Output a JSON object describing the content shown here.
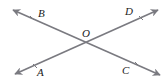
{
  "diagram": {
    "title": "",
    "line_color": "#7a7a80",
    "label_color": "#222222",
    "intersection": {
      "label": "O",
      "x": 87,
      "y": 43
    },
    "lines": [
      {
        "name": "line-BC",
        "from": {
          "x": 13,
          "y": 10
        },
        "to": {
          "x": 160,
          "y": 75
        },
        "arrows": "both"
      },
      {
        "name": "line-AD",
        "from": {
          "x": 15,
          "y": 74
        },
        "to": {
          "x": 158,
          "y": 10
        },
        "arrows": "both"
      }
    ],
    "points": [
      {
        "label": "B",
        "x": 38,
        "y": 17
      },
      {
        "label": "D",
        "x": 125,
        "y": 15
      },
      {
        "label": "A",
        "x": 37,
        "y": 76
      },
      {
        "label": "C",
        "x": 122,
        "y": 74
      },
      {
        "label": "O",
        "x": 82,
        "y": 37
      }
    ]
  }
}
